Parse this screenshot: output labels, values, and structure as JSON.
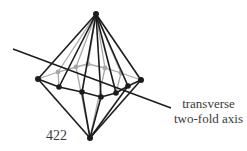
{
  "diagram": {
    "point_group_label": "422",
    "axis_label_line1": "transverse",
    "axis_label_line2": "two-fold axis",
    "colors": {
      "front_edges": "#1c1c1c",
      "back_edges": "#a8a8a8",
      "axis": "#1c1c1c",
      "text": "#3a3a3a"
    },
    "vertices": {
      "top": [
        96,
        14
      ],
      "bottom": [
        90,
        138
      ],
      "front_belt": [
        [
          38,
          79
        ],
        [
          59,
          87
        ],
        [
          82,
          92
        ],
        [
          101,
          97
        ],
        [
          116,
          93
        ],
        [
          128,
          86
        ],
        [
          141,
          80
        ]
      ],
      "back_belt": [
        [
          58,
          72
        ],
        [
          76,
          67
        ],
        [
          88,
          64
        ],
        [
          105,
          68
        ],
        [
          121,
          73
        ]
      ]
    },
    "axis_line": {
      "from": [
        13,
        49
      ],
      "to": [
        171,
        108
      ]
    }
  }
}
